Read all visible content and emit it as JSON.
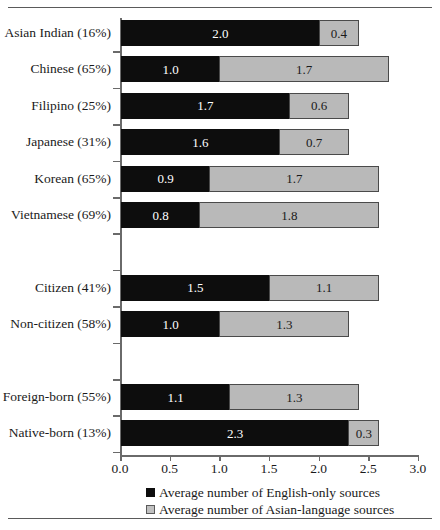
{
  "chart_data": {
    "type": "bar",
    "orientation": "horizontal",
    "stacked": true,
    "title": "",
    "xlabel": "",
    "ylabel": "",
    "xlim": [
      0.0,
      3.0
    ],
    "xticks": [
      "0.0",
      "0.5",
      "1.0",
      "1.5",
      "2.0",
      "2.5",
      "3.0"
    ],
    "grid": false,
    "legend_position": "bottom",
    "categories": [
      "Asian Indian (16%)",
      "Chinese (65%)",
      "Filipino (25%)",
      "Japanese (31%)",
      "Korean (65%)",
      "Vietnamese (69%)",
      "Citizen (41%)",
      "Non-citizen (58%)",
      "Foreign-born (55%)",
      "Native-born (13%)"
    ],
    "series": [
      {
        "name": "Average number of English-only sources",
        "color": "#0d0d0d",
        "values": [
          2.0,
          1.0,
          1.7,
          1.6,
          0.9,
          0.8,
          1.5,
          1.0,
          1.1,
          2.3
        ]
      },
      {
        "name": "Average number of Asian-language sources",
        "color": "#b9b9b9",
        "values": [
          0.4,
          1.7,
          0.6,
          0.7,
          1.7,
          1.8,
          1.1,
          1.3,
          1.3,
          0.3
        ]
      }
    ],
    "rows": [
      {
        "label": "Asian Indian (16%)",
        "english": "2.0",
        "asian": "0.4",
        "slot": 0
      },
      {
        "label": "Chinese (65%)",
        "english": "1.0",
        "asian": "1.7",
        "slot": 1
      },
      {
        "label": "Filipino (25%)",
        "english": "1.7",
        "asian": "0.6",
        "slot": 2
      },
      {
        "label": "Japanese (31%)",
        "english": "1.6",
        "asian": "0.7",
        "slot": 3
      },
      {
        "label": "Korean (65%)",
        "english": "0.9",
        "asian": "1.7",
        "slot": 4
      },
      {
        "label": "Vietnamese (69%)",
        "english": "0.8",
        "asian": "1.8",
        "slot": 5
      },
      {
        "label": "Citizen (41%)",
        "english": "1.5",
        "asian": "1.1",
        "slot": 7
      },
      {
        "label": "Non-citizen (58%)",
        "english": "1.0",
        "asian": "1.3",
        "slot": 8
      },
      {
        "label": "Foreign-born (55%)",
        "english": "1.1",
        "asian": "1.3",
        "slot": 10
      },
      {
        "label": "Native-born (13%)",
        "english": "2.3",
        "asian": "0.3",
        "slot": 11
      }
    ],
    "legend": [
      {
        "marker": "black-square",
        "label": "Average number of English-only sources"
      },
      {
        "marker": "gray-square",
        "label": "Average number of Asian-language sources"
      }
    ]
  },
  "geometry": {
    "axis_x": 120,
    "axis_top": 18,
    "baseline_y": 455,
    "px_per_unit": 99.3,
    "slot_pitch": 36.4,
    "slot_top": 20,
    "bar_height": 26,
    "total_slots": 12
  }
}
